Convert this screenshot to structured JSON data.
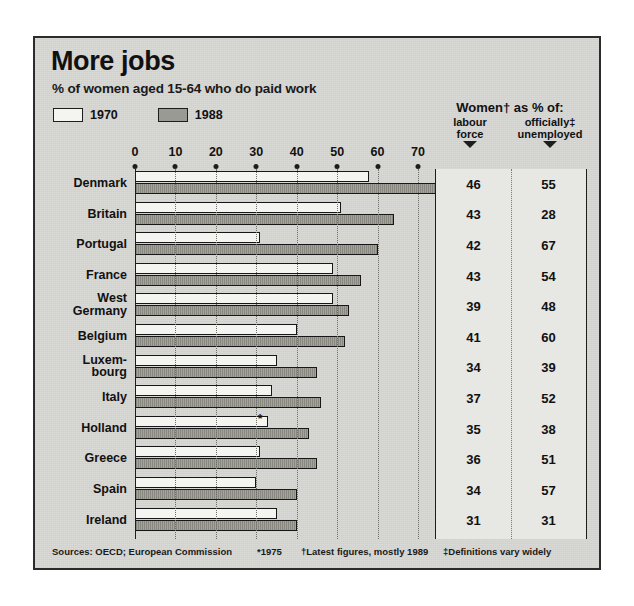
{
  "title": "More jobs",
  "subtitle": "% of women aged 15-64 who do paid work",
  "legend": [
    {
      "label": "1970",
      "swatch": "white"
    },
    {
      "label": "1988",
      "swatch": "grey"
    }
  ],
  "table_header": {
    "main": "Women† as % of:",
    "col1": "labour force",
    "col1_line1": "labour",
    "col1_line2": "force",
    "col2_line1": "officially‡",
    "col2_line2": "unemployed",
    "col2": "officially‡ unemployed"
  },
  "footnotes": {
    "sources": "Sources: OECD; European Commission",
    "star": "*1975",
    "dagger": "†Latest figures, mostly 1989",
    "doubledagger": "‡Definitions vary widely"
  },
  "chart_data": {
    "type": "bar",
    "orientation": "horizontal",
    "title": "More jobs",
    "subtitle": "% of women aged 15-64 who do paid work",
    "xlabel": "",
    "ylabel": "",
    "xlim": [
      0,
      70
    ],
    "ticks": [
      0,
      10,
      20,
      30,
      40,
      50,
      60,
      70
    ],
    "grid": "vertical dotted at each tick",
    "legend_position": "top-left",
    "categories": [
      "Denmark",
      "Britain",
      "Portugal",
      "France",
      "West Germany",
      "Belgium",
      "Luxembourg",
      "Italy",
      "Holland",
      "Greece",
      "Spain",
      "Ireland"
    ],
    "series": [
      {
        "name": "1970",
        "values": [
          58,
          51,
          31,
          49,
          49,
          40,
          35,
          34,
          33,
          31,
          30,
          35
        ]
      },
      {
        "name": "1988",
        "values": [
          76,
          64,
          60,
          56,
          53,
          52,
          45,
          46,
          43,
          45,
          40,
          40
        ]
      }
    ],
    "annotations": [
      {
        "category": "Holland",
        "series": "1970",
        "marker": "*",
        "note": "1975"
      }
    ],
    "table": {
      "columns": [
        "labour force",
        "officially unemployed"
      ],
      "rows": [
        {
          "country": "Denmark",
          "labour_force": 46,
          "officially_unemployed": 55
        },
        {
          "country": "Britain",
          "labour_force": 43,
          "officially_unemployed": 28
        },
        {
          "country": "Portugal",
          "labour_force": 42,
          "officially_unemployed": 67
        },
        {
          "country": "France",
          "labour_force": 43,
          "officially_unemployed": 54
        },
        {
          "country": "West Germany",
          "labour_force": 39,
          "officially_unemployed": 48
        },
        {
          "country": "Belgium",
          "labour_force": 41,
          "officially_unemployed": 60
        },
        {
          "country": "Luxembourg",
          "labour_force": 34,
          "officially_unemployed": 39
        },
        {
          "country": "Italy",
          "labour_force": 37,
          "officially_unemployed": 52
        },
        {
          "country": "Holland",
          "labour_force": 35,
          "officially_unemployed": 38
        },
        {
          "country": "Greece",
          "labour_force": 36,
          "officially_unemployed": 51
        },
        {
          "country": "Spain",
          "labour_force": 34,
          "officially_unemployed": 57
        },
        {
          "country": "Ireland",
          "labour_force": 31,
          "officially_unemployed": 31
        }
      ]
    }
  },
  "country_labels": [
    "Denmark",
    "Britain",
    "Portugal",
    "France",
    "West\nGermany",
    "Belgium",
    "Luxem-\nbourg",
    "Italy",
    "Holland",
    "Greece",
    "Spain",
    "Ireland"
  ],
  "colors": {
    "panel_bg": "#d9d9d6",
    "bar_1970": "#f4f4f0",
    "bar_1988": "#97978f",
    "ink": "#111111",
    "table_bg": "#e7e7e3"
  }
}
